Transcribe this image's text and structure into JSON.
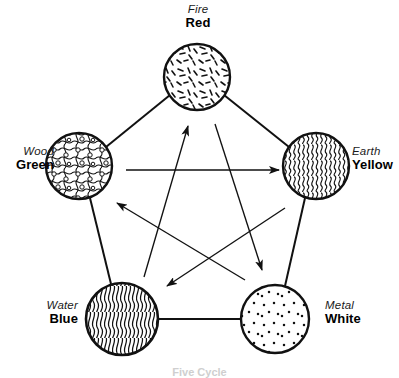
{
  "diagram": {
    "caption": "Five Cycle",
    "background_color": "#ffffff",
    "stroke_color": "#111111",
    "nodes": [
      {
        "id": "fire",
        "element": "Fire",
        "color_name": "Red",
        "texture": "short-dashes",
        "cx": 197,
        "cy": 77,
        "r": 33
      },
      {
        "id": "wood",
        "element": "Wood",
        "color_name": "Green",
        "texture": "squiggles-with-bubbles",
        "cx": 79,
        "cy": 166,
        "r": 33
      },
      {
        "id": "earth",
        "element": "Earth",
        "color_name": "Yellow",
        "texture": "dense-vertical-squiggles",
        "cx": 316,
        "cy": 166,
        "r": 33
      },
      {
        "id": "water",
        "element": "Water",
        "color_name": "Blue",
        "texture": "dense-flowing-waves",
        "cx": 122,
        "cy": 319,
        "r": 36
      },
      {
        "id": "metal",
        "element": "Metal",
        "color_name": "White",
        "texture": "sparse-dots",
        "cx": 275,
        "cy": 319,
        "r": 34
      }
    ],
    "outer_edges": [
      {
        "from": "wood",
        "to": "fire"
      },
      {
        "from": "fire",
        "to": "earth"
      },
      {
        "from": "earth",
        "to": "metal"
      },
      {
        "from": "metal",
        "to": "water"
      },
      {
        "from": "water",
        "to": "wood"
      }
    ],
    "inner_arrows": [
      {
        "from": "wood",
        "to": "earth",
        "label": "wood-overcomes-earth"
      },
      {
        "from": "earth",
        "to": "water",
        "label": "earth-overcomes-water"
      },
      {
        "from": "water",
        "to": "fire",
        "label": "water-overcomes-fire"
      },
      {
        "from": "fire",
        "to": "metal",
        "label": "fire-overcomes-metal"
      },
      {
        "from": "metal",
        "to": "wood",
        "label": "metal-overcomes-wood"
      }
    ]
  },
  "labels": {
    "fire": {
      "element": "Fire",
      "color_name": "Red"
    },
    "wood": {
      "element": "Wood",
      "color_name": "Green"
    },
    "earth": {
      "element": "Earth",
      "color_name": "Yellow"
    },
    "water": {
      "element": "Water",
      "color_name": "Blue"
    },
    "metal": {
      "element": "Metal",
      "color_name": "White"
    }
  }
}
